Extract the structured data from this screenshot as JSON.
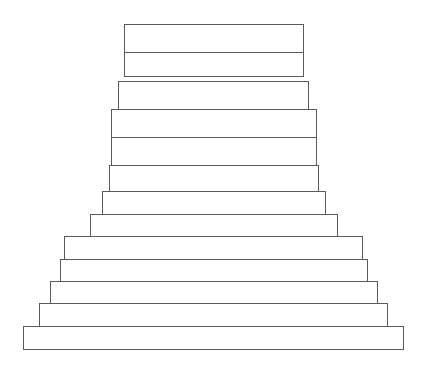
{
  "diagram": {
    "title": "",
    "stroke_color": "#5a5a5a",
    "fill_color": "#ffffff",
    "blocks": [
      {
        "id": "block-1",
        "x": 124,
        "y": 24,
        "w": 180,
        "h": 29
      },
      {
        "id": "block-2",
        "x": 124,
        "y": 52,
        "w": 180,
        "h": 25
      },
      {
        "id": "block-3",
        "x": 118,
        "y": 81,
        "w": 191,
        "h": 29
      },
      {
        "id": "block-4",
        "x": 111,
        "y": 109,
        "w": 206,
        "h": 29
      },
      {
        "id": "block-5",
        "x": 111,
        "y": 137,
        "w": 206,
        "h": 29
      },
      {
        "id": "block-6",
        "x": 109,
        "y": 165,
        "w": 210,
        "h": 27
      },
      {
        "id": "block-7",
        "x": 102,
        "y": 191,
        "w": 224,
        "h": 24
      },
      {
        "id": "block-8",
        "x": 90,
        "y": 214,
        "w": 248,
        "h": 24
      },
      {
        "id": "block-9",
        "x": 64,
        "y": 236,
        "w": 299,
        "h": 24
      },
      {
        "id": "block-10",
        "x": 60,
        "y": 259,
        "w": 308,
        "h": 23
      },
      {
        "id": "block-11",
        "x": 50,
        "y": 281,
        "w": 328,
        "h": 23
      },
      {
        "id": "block-12",
        "x": 39,
        "y": 303,
        "w": 349,
        "h": 24
      },
      {
        "id": "block-13",
        "x": 23,
        "y": 326,
        "w": 381,
        "h": 24
      }
    ]
  }
}
